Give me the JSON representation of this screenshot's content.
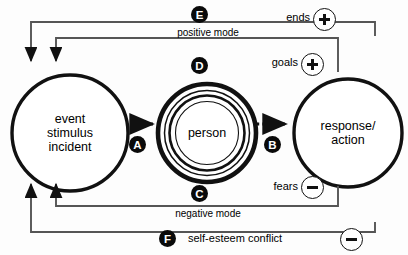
{
  "diagram": {
    "type": "feedback-loop",
    "nodes": [
      {
        "id": "event",
        "label": "event\nstimulus\nincident"
      },
      {
        "id": "person",
        "label": "person"
      },
      {
        "id": "response",
        "label": "response/\naction"
      }
    ],
    "flow_arrows": [
      {
        "id": "A",
        "marker": "A",
        "from": "event",
        "to": "person",
        "style": "dotted"
      },
      {
        "id": "B",
        "marker": "B",
        "from": "person",
        "to": "response",
        "style": "dotted"
      }
    ],
    "feedback_paths": [
      {
        "marker": "D",
        "label": "",
        "sign_label": "goals",
        "sign": "+",
        "mode": "positive"
      },
      {
        "marker": "E",
        "label": "positive mode",
        "sign_label": "ends",
        "sign": "+",
        "mode": "positive"
      },
      {
        "marker": "C",
        "label": "negative mode",
        "sign_label": "fears",
        "sign": "-",
        "mode": "negative"
      },
      {
        "marker": "F",
        "label": "",
        "sign_label": "self-esteem conflict",
        "sign": "-",
        "mode": "negative"
      }
    ],
    "mode_labels": {
      "positive": "positive mode",
      "negative": "negative mode"
    },
    "sign_labels": {
      "ends": "ends",
      "goals": "goals",
      "fears": "fears",
      "self_esteem": "self-esteem conflict"
    },
    "markers": {
      "a": "A",
      "b": "B",
      "c": "C",
      "d": "D",
      "e": "E",
      "f": "F"
    },
    "colors": {
      "ink": "#111111",
      "paper": "#ffffff",
      "marker_fill": "#0a0a0a"
    }
  }
}
